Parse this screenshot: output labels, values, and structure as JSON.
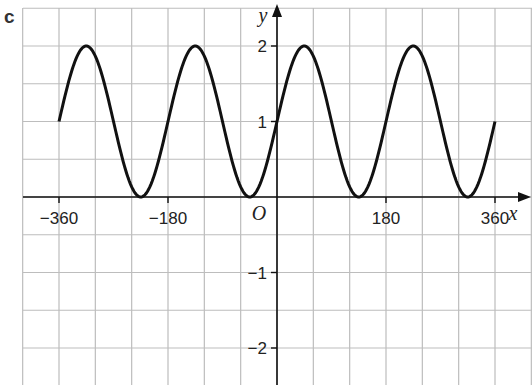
{
  "figure_label": "c",
  "chart_data": {
    "type": "line",
    "title": "",
    "function": "y = sin(2x) + 1",
    "xlabel": "x",
    "ylabel": "y",
    "xlim": [
      -360,
      360
    ],
    "ylim": [
      -2.5,
      2.5
    ],
    "grid": true,
    "x_grid_step": 60,
    "y_grid_step": 0.5,
    "x_ticks": [
      -360,
      -180,
      180,
      360
    ],
    "x_tick_labels": [
      "−360",
      "−180",
      "180",
      "360"
    ],
    "y_ticks": [
      2,
      1,
      -1,
      -2
    ],
    "y_tick_labels": [
      "2",
      "1",
      "−1",
      "−2"
    ],
    "origin_label": "O",
    "series": [
      {
        "name": "curve",
        "x": [
          -360,
          -315,
          -270,
          -225,
          -180,
          -135,
          -90,
          -45,
          0,
          45,
          90,
          135,
          180,
          225,
          270,
          315,
          360
        ],
        "values": [
          1,
          2,
          1,
          0,
          1,
          2,
          1,
          0,
          1,
          2,
          1,
          0,
          1,
          2,
          1,
          0,
          1
        ]
      }
    ],
    "legend": null
  },
  "colors": {
    "grid": "#bdbdbd",
    "axis": "#111111",
    "curve": "#111111"
  }
}
